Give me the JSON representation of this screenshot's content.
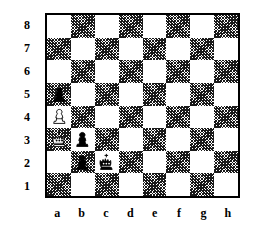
{
  "board": {
    "title": "Chess diagram",
    "orientation": "white-bottom",
    "light_square_color": "#ffffff",
    "dark_square_color": "#1a1a1a",
    "border_color": "#000000",
    "rank_labels": [
      "8",
      "7",
      "6",
      "5",
      "4",
      "3",
      "2",
      "1"
    ],
    "file_labels": [
      "a",
      "b",
      "c",
      "d",
      "e",
      "f",
      "g",
      "h"
    ],
    "squares": [
      [
        "a8",
        "b8",
        "c8",
        "d8",
        "e8",
        "f8",
        "g8",
        "h8"
      ],
      [
        "a7",
        "b7",
        "c7",
        "d7",
        "e7",
        "f7",
        "g7",
        "h7"
      ],
      [
        "a6",
        "b6",
        "c6",
        "d6",
        "e6",
        "f6",
        "g6",
        "h6"
      ],
      [
        "a5",
        "b5",
        "c5",
        "d5",
        "e5",
        "f5",
        "g5",
        "h5"
      ],
      [
        "a4",
        "b4",
        "c4",
        "d4",
        "e4",
        "f4",
        "g4",
        "h4"
      ],
      [
        "a3",
        "b3",
        "c3",
        "d3",
        "e3",
        "f3",
        "g3",
        "h3"
      ],
      [
        "a2",
        "b2",
        "c2",
        "d2",
        "e2",
        "f2",
        "g2",
        "h2"
      ],
      [
        "a1",
        "b1",
        "c1",
        "d1",
        "e1",
        "f1",
        "g1",
        "h1"
      ]
    ],
    "position": [
      [
        null,
        null,
        null,
        null,
        null,
        null,
        null,
        null
      ],
      [
        null,
        null,
        null,
        null,
        null,
        null,
        null,
        null
      ],
      [
        null,
        null,
        null,
        null,
        null,
        null,
        null,
        null
      ],
      [
        "black-pawn",
        null,
        null,
        null,
        null,
        null,
        null,
        null
      ],
      [
        "white-pawn",
        null,
        null,
        null,
        null,
        null,
        null,
        null
      ],
      [
        "white-king",
        "black-pawn",
        null,
        null,
        null,
        null,
        null,
        null
      ],
      [
        null,
        "black-pawn",
        "black-king",
        null,
        null,
        null,
        null,
        null
      ],
      [
        null,
        null,
        null,
        null,
        null,
        null,
        null,
        null
      ]
    ],
    "pieces": [
      {
        "square": "a5",
        "piece": "black-pawn",
        "glyph": "♟",
        "color": "black",
        "type": "pawn"
      },
      {
        "square": "a4",
        "piece": "white-pawn",
        "glyph": "♙",
        "color": "white",
        "type": "pawn"
      },
      {
        "square": "a3",
        "piece": "white-king",
        "glyph": "♔",
        "color": "white",
        "type": "king"
      },
      {
        "square": "b3",
        "piece": "black-pawn",
        "glyph": "♟",
        "color": "black",
        "type": "pawn"
      },
      {
        "square": "b2",
        "piece": "black-pawn",
        "glyph": "♟",
        "color": "black",
        "type": "pawn"
      },
      {
        "square": "c2",
        "piece": "black-king",
        "glyph": "♚",
        "color": "black",
        "type": "king"
      }
    ],
    "fen": "8/8/8/p7/P7/Kp6/1pk5/8"
  }
}
